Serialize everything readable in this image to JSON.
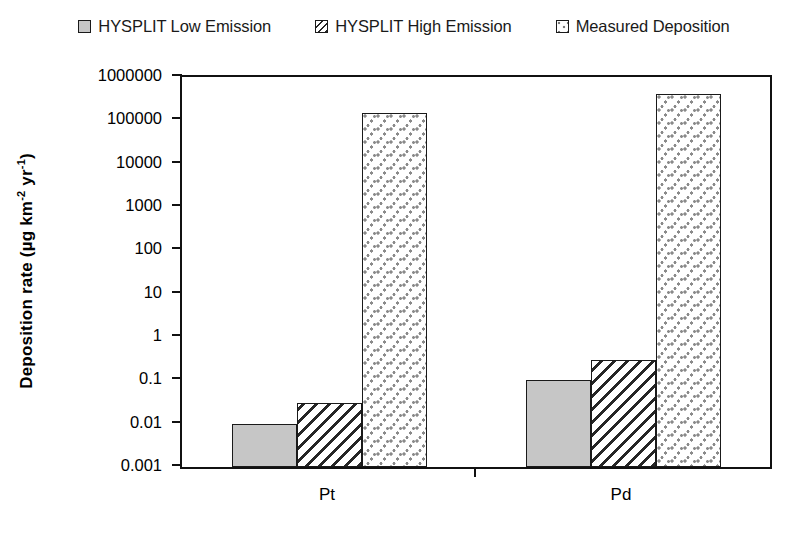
{
  "legend": {
    "entries": [
      {
        "label": "HYSPLIT Low Emission",
        "pattern": "solid-gray",
        "color": "#c6c6c6"
      },
      {
        "label": "HYSPLIT High Emission",
        "pattern": "diagonal-hatch",
        "color": "#262626"
      },
      {
        "label": "Measured Deposition",
        "pattern": "dots",
        "color": "#8a8a8a"
      }
    ]
  },
  "axes": {
    "y_title_main": "Deposition rate (µg km",
    "y_title_sup1": "-2",
    "y_title_mid": " yr",
    "y_title_sup2": "-1",
    "y_title_end": ")",
    "y_title_full": "Deposition rate (µg km-2 yr-1)",
    "y_ticks": [
      "1000000",
      "100000",
      "10000",
      "1000",
      "100",
      "10",
      "1",
      "0.1",
      "0.01",
      "0.001"
    ],
    "x_ticks": [
      "Pt",
      "Pd"
    ]
  },
  "chart_data": {
    "type": "bar",
    "title": "",
    "subtitle": "",
    "xlabel": "",
    "ylabel": "Deposition rate (µg km-2 yr-1)",
    "yscale": "log",
    "ylim": [
      0.001,
      1000000
    ],
    "ytick_values": [
      0.001,
      0.01,
      0.1,
      1,
      10,
      100,
      1000,
      10000,
      100000,
      1000000
    ],
    "ytick_labels": [
      "0.001",
      "0.01",
      "0.1",
      "1",
      "10",
      "100",
      "1000",
      "10000",
      "100000",
      "1000000"
    ],
    "grid": false,
    "legend_position": "top-center",
    "categories": [
      "Pt",
      "Pd"
    ],
    "series": [
      {
        "name": "HYSPLIT Low Emission",
        "values": [
          0.01,
          0.1
        ]
      },
      {
        "name": "HYSPLIT High Emission",
        "values": [
          0.03,
          0.3
        ]
      },
      {
        "name": "Measured Deposition",
        "values": [
          150000,
          400000
        ]
      }
    ]
  }
}
